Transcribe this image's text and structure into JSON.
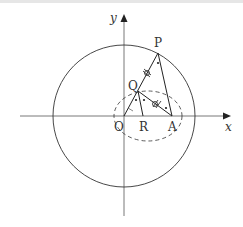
{
  "diagram": {
    "axes": {
      "x_label": "x",
      "y_label": "y"
    },
    "points": {
      "O": {
        "label": "O"
      },
      "P": {
        "label": "P"
      },
      "Q": {
        "label": "Q"
      },
      "R": {
        "label": "R"
      },
      "A": {
        "label": "A"
      }
    },
    "shapes": [
      "circle centered at O",
      "dashed ellipse with foci O and A",
      "segments OP, PA, QA, QR"
    ],
    "marks": {
      "equal_length_ticks": "PQ = QA (double-crossed marks)",
      "equal_angle_dots": "angle bisector dots"
    },
    "colors": {
      "stroke": "#222222",
      "axis": "#555555"
    }
  }
}
